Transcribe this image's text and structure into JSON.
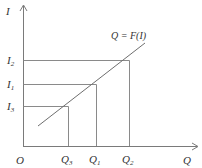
{
  "diagram": {
    "type": "function-mapping",
    "function_label": "Q = F(I)",
    "y_axis": {
      "label": "I"
    },
    "x_axis": {
      "label": "Q"
    },
    "origin_label": "O",
    "y_levels": [
      {
        "main": "I",
        "sub": "2",
        "value": 3
      },
      {
        "main": "I",
        "sub": "1",
        "value": 2
      },
      {
        "main": "I",
        "sub": "3",
        "value": 1
      }
    ],
    "x_levels": [
      {
        "main": "Q",
        "sub": "3",
        "value": 1
      },
      {
        "main": "Q",
        "sub": "1",
        "value": 2
      },
      {
        "main": "Q",
        "sub": "2",
        "value": 3
      }
    ],
    "mappings": [
      {
        "from": "I3",
        "to": "Q3"
      },
      {
        "from": "I1",
        "to": "Q1"
      },
      {
        "from": "I2",
        "to": "Q2"
      }
    ],
    "colors": {
      "lines": "#7a7a7a",
      "text": "#333333"
    }
  }
}
